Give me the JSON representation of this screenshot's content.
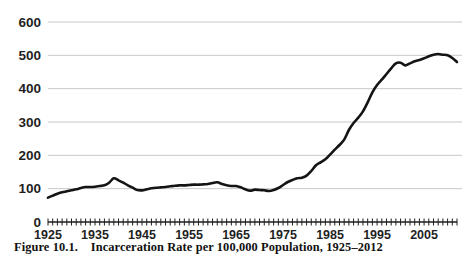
{
  "figure": {
    "caption_label": "Figure 10.1.",
    "caption_title": "Incarceration Rate per 100,000 Population, 1925–2012",
    "caption_full": "Figure 10.1.    Incarceration Rate per 100,000 Population, 1925–2012"
  },
  "colors": {
    "line": "#141414",
    "grid": "#c8c8c8",
    "axis": "#1f1f1f",
    "text": "#1f1f1f",
    "background": "#ffffff"
  },
  "chart_data": {
    "type": "line",
    "title": "Incarceration Rate per 100,000 Population, 1925–2012",
    "xlabel": "",
    "ylabel": "",
    "xlim": [
      1925,
      2012
    ],
    "ylim": [
      0,
      600
    ],
    "ytick_labels": [
      "0",
      "100",
      "200",
      "300",
      "400",
      "500",
      "600"
    ],
    "yticks": [
      0,
      100,
      200,
      300,
      400,
      500,
      600
    ],
    "xtick_labels": [
      "1925",
      "1935",
      "1945",
      "1955",
      "1965",
      "1975",
      "1985",
      "1995",
      "2005"
    ],
    "xticks": [
      1925,
      1935,
      1945,
      1955,
      1965,
      1975,
      1985,
      1995,
      2005
    ],
    "grid": "horizontal",
    "legend": "none",
    "minor_xticks_every": 1,
    "series": [
      {
        "name": "Incarceration rate per 100,000",
        "x": [
          1925,
          1926,
          1927,
          1928,
          1929,
          1930,
          1931,
          1932,
          1933,
          1934,
          1935,
          1936,
          1937,
          1938,
          1939,
          1940,
          1941,
          1942,
          1943,
          1944,
          1945,
          1946,
          1947,
          1948,
          1949,
          1950,
          1951,
          1952,
          1953,
          1954,
          1955,
          1956,
          1957,
          1958,
          1959,
          1960,
          1961,
          1962,
          1963,
          1964,
          1965,
          1966,
          1967,
          1968,
          1969,
          1970,
          1971,
          1972,
          1973,
          1974,
          1975,
          1976,
          1977,
          1978,
          1979,
          1980,
          1981,
          1982,
          1983,
          1984,
          1985,
          1986,
          1987,
          1988,
          1989,
          1990,
          1991,
          1992,
          1993,
          1994,
          1995,
          1996,
          1997,
          1998,
          1999,
          2000,
          2001,
          2002,
          2003,
          2004,
          2005,
          2006,
          2007,
          2008,
          2009,
          2010,
          2011,
          2012
        ],
        "values": [
          73,
          79,
          85,
          89,
          92,
          95,
          98,
          102,
          105,
          105,
          106,
          108,
          110,
          118,
          131,
          125,
          118,
          110,
          103,
          96,
          95,
          98,
          101,
          103,
          104,
          105,
          107,
          109,
          110,
          110,
          111,
          112,
          112,
          113,
          114,
          117,
          119,
          114,
          110,
          108,
          108,
          104,
          98,
          94,
          97,
          96,
          95,
          93,
          96,
          102,
          111,
          120,
          126,
          131,
          133,
          139,
          153,
          170,
          179,
          188,
          202,
          217,
          231,
          247,
          276,
          297,
          313,
          332,
          359,
          389,
          411,
          427,
          444,
          461,
          476,
          478,
          470,
          476,
          482,
          486,
          491,
          497,
          502,
          504,
          502,
          500,
          492,
          480
        ]
      }
    ]
  }
}
